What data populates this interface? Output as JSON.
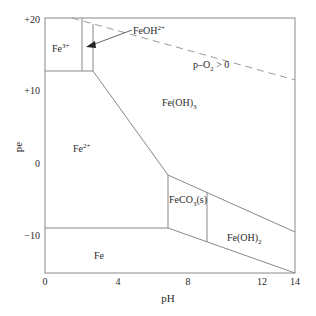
{
  "diagram": {
    "type": "pe-pH predominance diagram",
    "axes": {
      "x": {
        "label": "pH",
        "ticks": [
          "0",
          "4",
          "8",
          "12",
          "14"
        ],
        "range": [
          0,
          14
        ]
      },
      "y": {
        "label": "pe",
        "ticks": [
          "+20",
          "+10",
          "0",
          "−10"
        ],
        "range": [
          -15,
          20
        ]
      }
    },
    "regions": {
      "fe3": {
        "base": "Fe",
        "sup": "3+"
      },
      "fe2": {
        "base": "Fe",
        "sup": "2+"
      },
      "feoh2": {
        "base": "FeOH",
        "sup": "2+"
      },
      "feoh3": {
        "base": "Fe(OH)",
        "sub": "3"
      },
      "feco3": {
        "base": "FeCO",
        "sub": "3",
        "tail": "(s)"
      },
      "feoh2s": {
        "base": "Fe(OH)",
        "sub": "2"
      },
      "fe": {
        "base": "Fe"
      }
    },
    "o2_line_label": {
      "pre": "p–O",
      "sub": "2",
      "post": " > 0"
    },
    "colors": {
      "line": "#888888",
      "dashed": "#999999",
      "text": "#2a2a2a"
    }
  }
}
